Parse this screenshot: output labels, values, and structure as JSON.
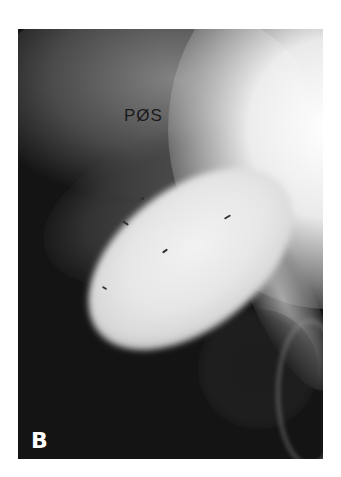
{
  "figure": {
    "panel_label": "B",
    "annotation": "PØS",
    "colors": {
      "background": "#141414",
      "bright_region": "#f2f2f2",
      "page": "#ffffff"
    }
  }
}
